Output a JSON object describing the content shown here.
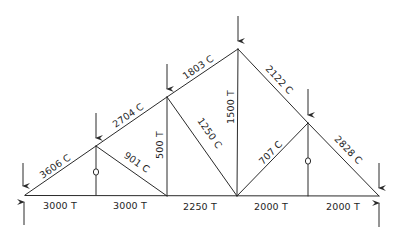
{
  "diagram": {
    "type": "truss",
    "nodes": {
      "L0": [
        25,
        195
      ],
      "U1": [
        96,
        146
      ],
      "U2": [
        167,
        97
      ],
      "U3": [
        238,
        49
      ],
      "U4": [
        308,
        123
      ],
      "R0": [
        379,
        196
      ],
      "B1": [
        96,
        195
      ],
      "B2": [
        167,
        196
      ],
      "B3": [
        237,
        196
      ],
      "B4": [
        308,
        196
      ]
    },
    "members": [
      {
        "id": "top-L0-U1",
        "from": "L0",
        "to": "U1",
        "force": "3606 C"
      },
      {
        "id": "top-U1-U2",
        "from": "U1",
        "to": "U2",
        "force": "2704 C"
      },
      {
        "id": "top-U2-U3",
        "from": "U2",
        "to": "U3",
        "force": "1803 C"
      },
      {
        "id": "top-U3-U4",
        "from": "U3",
        "to": "U4",
        "force": "2122 C"
      },
      {
        "id": "top-U4-R0",
        "from": "U4",
        "to": "R0",
        "force": "2828 C"
      },
      {
        "id": "bottom-L0-B1",
        "from": "L0",
        "to": "B1",
        "force": "3000 T"
      },
      {
        "id": "bottom-B1-B2",
        "from": "B1",
        "to": "B2",
        "force": "3000 T"
      },
      {
        "id": "bottom-B2-B3",
        "from": "B2",
        "to": "B3",
        "force": "2250 T"
      },
      {
        "id": "bottom-B3-B4",
        "from": "B3",
        "to": "B4",
        "force": "2000 T"
      },
      {
        "id": "bottom-B4-R0",
        "from": "B4",
        "to": "R0",
        "force": "2000 T"
      },
      {
        "id": "vert-U1-B1",
        "from": "U1",
        "to": "B1",
        "force": "0"
      },
      {
        "id": "diag-U1-B2",
        "from": "U1",
        "to": "B2",
        "force": "901 C"
      },
      {
        "id": "vert-U2-B2",
        "from": "U2",
        "to": "B2",
        "force": "500 T"
      },
      {
        "id": "diag-U2-B3",
        "from": "U2",
        "to": "B3",
        "force": "1250 C"
      },
      {
        "id": "vert-U3-B3",
        "from": "U3",
        "to": "B3",
        "force": "1500 T"
      },
      {
        "id": "diag-B3-U4",
        "from": "B3",
        "to": "U4",
        "force": "707 C"
      },
      {
        "id": "vert-U4-B4",
        "from": "U4",
        "to": "B4",
        "force": "0"
      }
    ],
    "labels": {
      "top1": "3606 C",
      "top2": "2704 C",
      "top3": "1803 C",
      "top4": "2122 C",
      "top5": "2828 C",
      "bot1": "3000 T",
      "bot2": "3000 T",
      "bot3": "2250 T",
      "bot4": "2000 T",
      "bot5": "2000 T",
      "diag1": "901 C",
      "vert2": "500 T",
      "diag2": "1250 C",
      "vert3": "1500 T",
      "diag3": "707 C"
    },
    "zero_force_markers": [
      {
        "member": "vert-U1-B1",
        "symbol": "O",
        "at": [
          96,
          172
        ]
      },
      {
        "member": "vert-U4-B4",
        "symbol": "O",
        "at": [
          308,
          161
        ]
      }
    ],
    "loads": [
      {
        "node": "L0",
        "direction": "down"
      },
      {
        "node": "U1",
        "direction": "down"
      },
      {
        "node": "U2",
        "direction": "down"
      },
      {
        "node": "U3",
        "direction": "down"
      },
      {
        "node": "U4",
        "direction": "down"
      },
      {
        "node": "R0",
        "direction": "down"
      }
    ],
    "reactions": [
      {
        "node": "L0",
        "direction": "up"
      },
      {
        "node": "R0",
        "direction": "up"
      }
    ],
    "colors": {
      "line": "#2a2a2a",
      "text": "#1e1e1e",
      "background": "#ffffff"
    }
  }
}
